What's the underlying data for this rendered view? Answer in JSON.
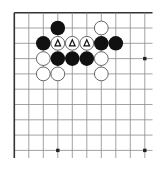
{
  "board": {
    "cols": 10,
    "rows": 10,
    "origin": {
      "x": 14.3,
      "y": 12.7
    },
    "spacing": {
      "x": 14.5,
      "y": 15.3
    },
    "right_edge_x": 152.5,
    "bottom_edge_y": 158,
    "line_color": "#8a8a8a",
    "edge_color": "#333333",
    "star_points": [
      [
        9,
        3
      ],
      [
        3,
        9
      ],
      [
        9,
        9
      ]
    ],
    "stones": [
      {
        "col": 3,
        "row": 1,
        "color": "black"
      },
      {
        "col": 6,
        "row": 1,
        "color": "white"
      },
      {
        "col": 2,
        "row": 2,
        "color": "black"
      },
      {
        "col": 3,
        "row": 2,
        "color": "white",
        "mark": "triangle"
      },
      {
        "col": 4,
        "row": 2,
        "color": "white",
        "mark": "triangle"
      },
      {
        "col": 5,
        "row": 2,
        "color": "white",
        "mark": "triangle"
      },
      {
        "col": 6,
        "row": 2,
        "color": "black"
      },
      {
        "col": 7,
        "row": 2,
        "color": "black"
      },
      {
        "col": 2,
        "row": 3,
        "color": "white"
      },
      {
        "col": 3,
        "row": 3,
        "color": "black"
      },
      {
        "col": 4,
        "row": 3,
        "color": "black"
      },
      {
        "col": 5,
        "row": 3,
        "color": "black"
      },
      {
        "col": 6,
        "row": 3,
        "color": "white"
      },
      {
        "col": 2,
        "row": 4,
        "color": "white"
      },
      {
        "col": 3,
        "row": 4,
        "color": "white"
      },
      {
        "col": 6,
        "row": 4,
        "color": "white"
      }
    ],
    "colors": {
      "black_stone": "#111111",
      "white_stone": "#ffffff",
      "white_stroke": "#444444",
      "mark": "#111111"
    }
  }
}
